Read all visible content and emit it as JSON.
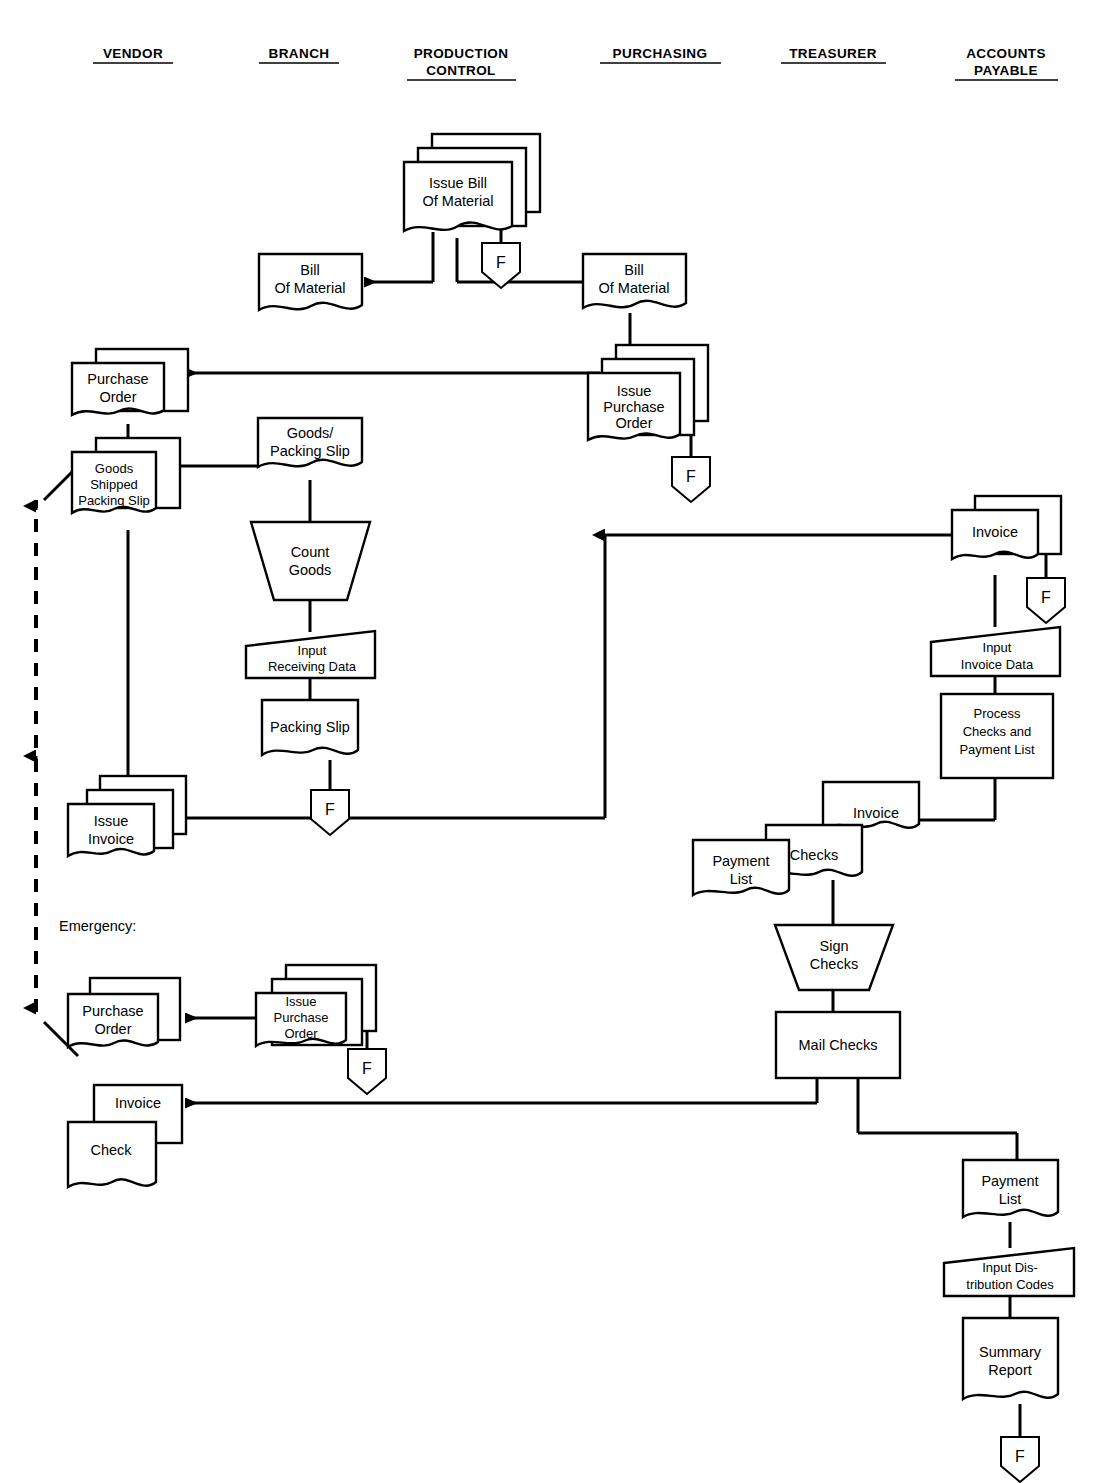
{
  "title_partial": "Accounts Payable Procedures",
  "columns": [
    {
      "id": "vendor",
      "label": "VENDOR",
      "x": 133
    },
    {
      "id": "branch",
      "label": "BRANCH",
      "x": 299
    },
    {
      "id": "production-control",
      "label": "PRODUCTION",
      "label2": "CONTROL",
      "x": 461
    },
    {
      "id": "purchasing",
      "label": "PURCHASING",
      "x": 660
    },
    {
      "id": "treasurer",
      "label": "TREASURER",
      "x": 833
    },
    {
      "id": "accounts-payable",
      "label": "ACCOUNTS",
      "label2": "PAYABLE",
      "x": 1006
    }
  ],
  "nodes": {
    "issue_bill_of_material": {
      "label1": "Issue Bill",
      "label2": "Of Material"
    },
    "bill_of_material_branch": {
      "label1": "Bill",
      "label2": "Of Material"
    },
    "bill_of_material_purch": {
      "label1": "Bill",
      "label2": "Of Material"
    },
    "purchase_order_vendor": {
      "label1": "Purchase",
      "label2": "Order"
    },
    "issue_purchase_order_purch": {
      "label1": "Issue",
      "label2": "Purchase",
      "label3": "Order"
    },
    "goods_shipped_packing_slip": {
      "label1": "Goods",
      "label2": "Shipped",
      "label3": "Packing Slip"
    },
    "goods_packing_slip": {
      "label1": "Goods/",
      "label2": "Packing Slip"
    },
    "count_goods": {
      "label1": "Count",
      "label2": "Goods"
    },
    "input_receiving_data": {
      "label1": "Input",
      "label2": "Receiving Data"
    },
    "packing_slip": {
      "label1": "Packing Slip"
    },
    "issue_invoice": {
      "label1": "Issue",
      "label2": "Invoice"
    },
    "invoice_ap": {
      "label1": "Invoice"
    },
    "input_invoice_data": {
      "label1": "Input",
      "label2": "Invoice Data"
    },
    "process_checks_payment_list": {
      "label1": "Process",
      "label2": "Checks and",
      "label3": "Payment List"
    },
    "invoice_treas": {
      "label1": "Invoice"
    },
    "checks_treas": {
      "label1": "Checks"
    },
    "payment_list_treas": {
      "label1": "Payment",
      "label2": "List"
    },
    "sign_checks": {
      "label1": "Sign",
      "label2": "Checks"
    },
    "mail_checks": {
      "label1": "Mail Checks"
    },
    "emergency_label": {
      "label1": "Emergency:"
    },
    "purchase_order_emergency": {
      "label1": "Purchase",
      "label2": "Order"
    },
    "issue_purchase_order_emergency": {
      "label1": "Issue",
      "label2": "Purchase",
      "label3": "Order"
    },
    "invoice_vendor_bottom": {
      "label1": "Invoice"
    },
    "check_vendor_bottom": {
      "label1": "Check"
    },
    "payment_list_ap": {
      "label1": "Payment",
      "label2": "List"
    },
    "input_distribution_codes": {
      "label1": "Input Dis-",
      "label2": "tribution Codes"
    },
    "summary_report": {
      "label1": "Summary",
      "label2": "Report"
    },
    "file_symbol": {
      "label": "F"
    }
  },
  "file_symbols": [
    {
      "id": "file-issue-bill-of-material",
      "x": 501,
      "y": 243
    },
    {
      "id": "file-issue-purchase-order",
      "x": 691,
      "y": 457
    },
    {
      "id": "file-packing-slip",
      "x": 330,
      "y": 790
    },
    {
      "id": "file-invoice-ap",
      "x": 1046,
      "y": 578
    },
    {
      "id": "file-issue-purchase-order-emergency",
      "x": 367,
      "y": 1049
    },
    {
      "id": "file-summary-report",
      "x": 1020,
      "y": 1437
    }
  ],
  "colors": {
    "stroke": "#000000",
    "fill": "#ffffff",
    "text": "#000000"
  }
}
